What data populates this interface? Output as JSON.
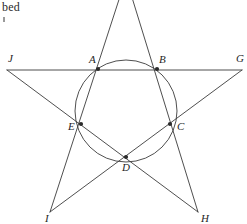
{
  "page": {
    "background_color": "#ffffff",
    "width": 247,
    "height": 224,
    "corner_text": "bed"
  },
  "figure": {
    "stroke_color": "#3b3b3b",
    "label_color": "#1f1f1f",
    "vertex_dot_color": "#2b2b2b"
  },
  "circle": {
    "center_x": 126,
    "center_y": 111,
    "radius": 51,
    "stroke_color": "#3b3b3b"
  },
  "points": [
    {
      "id": "A",
      "label": "A",
      "x": 98,
      "y": 69,
      "label_x": 89,
      "label_y": 63,
      "kind": "inner",
      "dot": true
    },
    {
      "id": "B",
      "label": "B",
      "x": 157,
      "y": 69,
      "label_x": 159,
      "label_y": 63,
      "kind": "inner",
      "dot": true
    },
    {
      "id": "C",
      "label": "C",
      "x": 170,
      "y": 124,
      "label_x": 177,
      "label_y": 130,
      "kind": "inner",
      "dot": true
    },
    {
      "id": "D",
      "label": "D",
      "x": 126,
      "y": 157,
      "label_x": 122,
      "label_y": 171,
      "kind": "inner",
      "dot": true
    },
    {
      "id": "E",
      "label": "E",
      "x": 81,
      "y": 124,
      "label_x": 68,
      "label_y": 130,
      "kind": "inner",
      "dot": true
    },
    {
      "id": "F",
      "label": "",
      "x": 126,
      "y": -22,
      "label_x": 126,
      "label_y": -22,
      "kind": "outer",
      "dot": false
    },
    {
      "id": "G",
      "label": "G",
      "x": 242,
      "y": 70,
      "label_x": 236,
      "label_y": 62,
      "kind": "outer",
      "dot": false
    },
    {
      "id": "H",
      "label": "H",
      "x": 198,
      "y": 212,
      "label_x": 201,
      "label_y": 222,
      "kind": "outer",
      "dot": false
    },
    {
      "id": "I",
      "label": "I",
      "x": 50,
      "y": 212,
      "label_x": 45,
      "label_y": 222,
      "kind": "outer",
      "dot": false
    },
    {
      "id": "J",
      "label": "J",
      "x": 7,
      "y": 70,
      "label_x": 8,
      "label_y": 62,
      "kind": "outer",
      "dot": false
    }
  ],
  "chords": [
    {
      "id": "J-G",
      "from": "J",
      "to": "G",
      "passes_through": [
        "A",
        "B"
      ]
    },
    {
      "id": "F-H",
      "from": "F",
      "to": "H",
      "passes_through": [
        "B",
        "C"
      ]
    },
    {
      "id": "G-I",
      "from": "G",
      "to": "I",
      "passes_through": [
        "C",
        "D",
        "E"
      ]
    },
    {
      "id": "H-J",
      "from": "H",
      "to": "J",
      "passes_through": [
        "D",
        "E",
        "A"
      ]
    },
    {
      "id": "F-I",
      "from": "F",
      "to": "I",
      "passes_through": [
        "A",
        "E"
      ]
    }
  ]
}
